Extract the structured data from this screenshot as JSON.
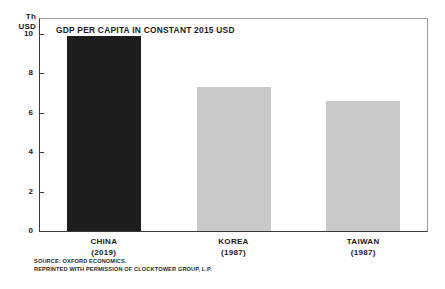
{
  "chart_data": {
    "type": "bar",
    "title": "GDP PER CAPITA IN CONSTANT 2015 USD",
    "xlabel": "",
    "ylabel": "Th USD",
    "ylabel_lines": [
      "Th",
      "USD"
    ],
    "categories": [
      "CHINA",
      "KOREA",
      "TAIWAN"
    ],
    "category_years": [
      "(2019)",
      "(1987)",
      "(1987)"
    ],
    "values": [
      9.9,
      7.3,
      6.6
    ],
    "ylim": [
      0,
      10.8
    ],
    "yticks": [
      0,
      2,
      4,
      6,
      8,
      10
    ],
    "ytick_labels": [
      "0",
      "2",
      "4",
      "6",
      "8",
      "10"
    ],
    "grid": false,
    "legend": "none",
    "bar_colors": [
      "#1d1d1d",
      "#c9c9c9",
      "#c9c9c9"
    ]
  },
  "notes": {
    "source_line_1": "SOURCE: OXFORD ECONOMICS.",
    "source_line_2": "REPRINTED WITH PERMISSION OF CLOCKTOWER GROUP, L.P."
  },
  "colors": {
    "dark_bar": "#1d1d1d",
    "light_bar": "#c9c9c9",
    "axis": "#3a3a3a",
    "frame": "#9a9a9a",
    "text": "#1a1a1a",
    "background": "#fefefe"
  }
}
